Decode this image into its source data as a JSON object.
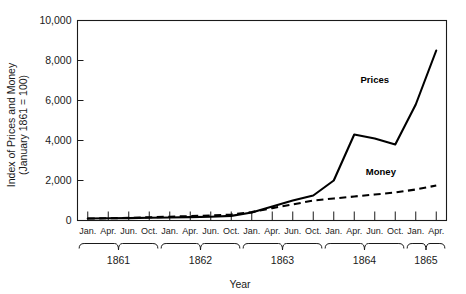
{
  "chart_data": {
    "type": "line",
    "title": "",
    "xlabel": "Year",
    "ylabel_line1": "Index of Prices and Money",
    "ylabel_line2": "(January 1861 = 100)",
    "ylim": [
      0,
      10000
    ],
    "yticks": [
      0,
      2000,
      4000,
      6000,
      8000,
      10000
    ],
    "ytick_labels": [
      "0",
      "2,000",
      "4,000",
      "6,000",
      "8,000",
      "10,000"
    ],
    "grid": false,
    "legend_position": "inline-annotation",
    "x_tick_labels": [
      "Jan.",
      "Apr.",
      "Jun.",
      "Oct.",
      "Jan.",
      "Apr.",
      "Jun.",
      "Oct.",
      "Jan.",
      "Apr.",
      "Jun.",
      "Oct.",
      "Jan.",
      "Apr.",
      "Jun.",
      "Oct.",
      "Jan.",
      "Apr."
    ],
    "year_groups": [
      {
        "label": "1861",
        "start_index": 0,
        "end_index": 3
      },
      {
        "label": "1862",
        "start_index": 4,
        "end_index": 7
      },
      {
        "label": "1863",
        "start_index": 8,
        "end_index": 11
      },
      {
        "label": "1864",
        "start_index": 12,
        "end_index": 15
      },
      {
        "label": "1865",
        "start_index": 16,
        "end_index": 17
      }
    ],
    "series": [
      {
        "name": "Prices",
        "style": "solid",
        "color": "#000000",
        "x": [
          0,
          1,
          2,
          3,
          4,
          5,
          6,
          7,
          8,
          9,
          10,
          11,
          12,
          13,
          14,
          15,
          16,
          17
        ],
        "values": [
          100,
          110,
          120,
          140,
          150,
          170,
          190,
          230,
          400,
          700,
          1000,
          1250,
          2000,
          4300,
          4100,
          3800,
          5800,
          8500
        ]
      },
      {
        "name": "Money",
        "style": "dashed",
        "color": "#000000",
        "x": [
          0,
          1,
          2,
          3,
          4,
          5,
          6,
          7,
          8,
          9,
          10,
          11,
          12,
          13,
          14,
          15,
          16,
          17
        ],
        "values": [
          100,
          110,
          130,
          160,
          190,
          220,
          250,
          300,
          420,
          620,
          800,
          1000,
          1100,
          1200,
          1300,
          1400,
          1550,
          1750
        ]
      }
    ],
    "annotations": [
      {
        "text": "Prices",
        "x_index": 14.0,
        "y_value": 6900
      },
      {
        "text": "Money",
        "x_index": 14.3,
        "y_value": 2300
      }
    ]
  }
}
